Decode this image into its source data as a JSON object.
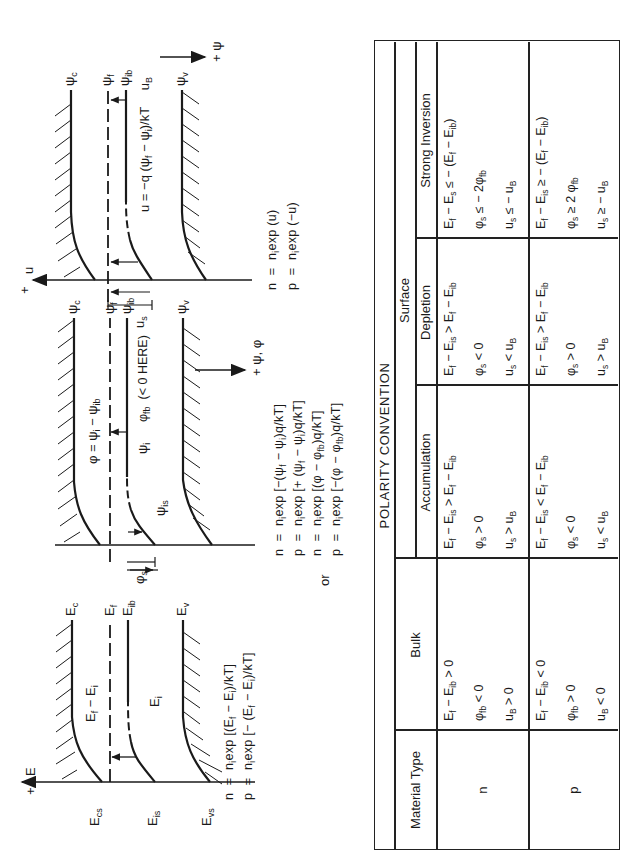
{
  "figure": {
    "energy_diagram": {
      "axis_label": "E",
      "axis_sign": "+",
      "levels": [
        "E_c",
        "E_f",
        "E_ib",
        "E_v"
      ],
      "surface_labels": [
        "E_cs",
        "E_is",
        "E_vs"
      ],
      "inner_labels": [
        "E_f − E_i",
        "E_i"
      ],
      "equations": [
        "n = n_i exp [(E_f − E_i)/kT]",
        "p = n_i exp [− (E_f − E_i)/kT]"
      ]
    },
    "or_label": "or",
    "potential_diagram": {
      "axis_label": "ψ, φ",
      "axis_sign": "+",
      "levels": [
        "ψ_c",
        "ψ_f",
        "ψ_ib",
        "ψ_v"
      ],
      "inner_labels": [
        "φ = ψ_i − ψ_ib",
        "ψ_i",
        "ψ_is",
        "φ_fb (< 0 HERE)"
      ],
      "surface_label": "φ_s",
      "equations": [
        "n = n_i exp [−(ψ_f − ψ_i)q/kT]",
        "p = n_i exp [+ (ψ_f − ψ_i)q/kT]",
        "n = n_i exp [(φ − φ_fb)q/kT]",
        "p = n_i exp [−(φ − φ_fb)q/kT]"
      ]
    },
    "normalized_diagram": {
      "axis_label": "u",
      "axis_sign": "+",
      "side_axis_label": "ψ",
      "levels": [
        "ψ_c",
        "ψ_f",
        "ψ_ib",
        "ψ_v"
      ],
      "inner_labels": [
        "u = −q (ψ_f − ψ_i)/kT",
        "u_B"
      ],
      "surface_label": "u_s",
      "equations": [
        "n = n_i exp (u)",
        "p = n_i exp (−u)"
      ]
    }
  },
  "table": {
    "title": "POLARITY CONVENTION",
    "headers": {
      "material_type": "Material Type",
      "bulk": "Bulk",
      "surface": "Surface",
      "accumulation": "Accumulation",
      "depletion": "Depletion",
      "strong_inversion": "Strong Inversion"
    },
    "rows": [
      {
        "material": "n",
        "bulk": [
          "E_f − E_ib > 0",
          "φ_fb < 0",
          "u_B > 0"
        ],
        "accumulation": [
          "E_f − E_is > E_f − E_ib",
          "φ_s > 0",
          "u_s > u_B"
        ],
        "depletion": [
          "E_f − E_is > E_f − E_ib",
          "φ_s < 0",
          "u_s < u_B"
        ],
        "strong_inversion": [
          "E_f − E_s ≤ − (E_f − E_ib)",
          "φ_s ≤ − 2φ_fb",
          "u_s ≤ − u_B"
        ]
      },
      {
        "material": "p",
        "bulk": [
          "E_f − E_ib < 0",
          "φ_fb > 0",
          "u_B < 0"
        ],
        "accumulation": [
          "E_f − E_is < E_f − E_ib",
          "φ_s < 0",
          "u_s < u_B"
        ],
        "depletion": [
          "E_f − E_is > E_f − E_ib",
          "φ_s > 0",
          "u_s > u_B"
        ],
        "strong_inversion": [
          "E_f − E_is ≥ − (E_f − E_ib)",
          "φ_s ≥ 2 φ_fb",
          "u_s ≥ − u_B"
        ]
      }
    ]
  }
}
